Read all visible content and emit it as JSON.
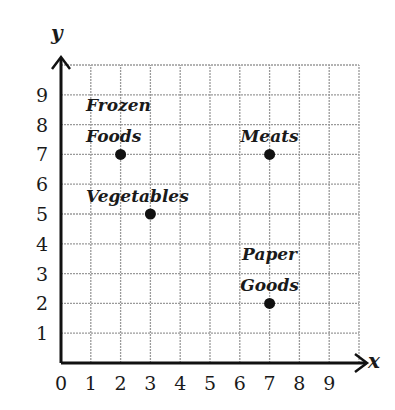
{
  "chart_data": {
    "type": "scatter",
    "title": "",
    "xlabel": "x",
    "ylabel": "y",
    "xlim": [
      0,
      10
    ],
    "ylim": [
      0,
      10
    ],
    "grid": true,
    "x_ticks": [
      "0",
      "1",
      "2",
      "3",
      "4",
      "5",
      "6",
      "7",
      "8",
      "9"
    ],
    "y_ticks": [
      "1",
      "2",
      "3",
      "4",
      "5",
      "6",
      "7",
      "8",
      "9"
    ],
    "points": [
      {
        "label": "Frozen Foods",
        "label_lines": [
          "Frozen",
          "Foods"
        ],
        "x": 2,
        "y": 7
      },
      {
        "label": "Meats",
        "label_lines": [
          "Meats"
        ],
        "x": 7,
        "y": 7
      },
      {
        "label": "Vegetables",
        "label_lines": [
          "Vegetables"
        ],
        "x": 3,
        "y": 5
      },
      {
        "label": "Paper Goods",
        "label_lines": [
          "Paper",
          "Goods"
        ],
        "x": 7,
        "y": 2
      }
    ]
  },
  "colors": {
    "grid": "#9a9a9a",
    "axis": "#111111",
    "point": "#111111"
  }
}
